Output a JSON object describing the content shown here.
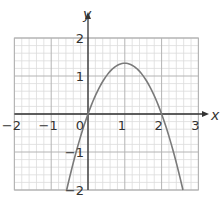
{
  "chart_data": {
    "type": "line",
    "title": "",
    "xlabel": "x",
    "ylabel": "y",
    "xlim": [
      -2,
      3
    ],
    "ylim": [
      -2,
      2
    ],
    "x_ticks": [
      "-2",
      "-1",
      "0",
      "1",
      "2",
      "3"
    ],
    "y_ticks": [
      "2",
      "1",
      "-1",
      "-2"
    ],
    "x_tick_values": [
      -2,
      -1,
      0,
      1,
      2,
      3
    ],
    "y_tick_values": [
      2,
      1,
      -1,
      -2
    ],
    "grid": true,
    "grid_minor_step": 0.2,
    "grid_major_step": 1,
    "legend": null,
    "series": [
      {
        "name": "parabola",
        "description": "downward-opening parabola with roots at x=0 and x=2, vertex at (1, 1)",
        "x": [
          -0.58,
          -0.25,
          0,
          0.5,
          1,
          1.5,
          2,
          2.25,
          2.58
        ],
        "y": [
          -2,
          -0.6,
          0,
          0.75,
          1,
          0.75,
          0,
          -0.6,
          -2
        ],
        "color": "#7a7a7a"
      }
    ],
    "key_points": {
      "vertex": [
        1,
        1
      ],
      "roots": [
        0,
        2
      ],
      "y_intercept": 0
    }
  },
  "colors": {
    "minor_grid": "#dcdcdc",
    "major_grid": "#b4b4b4",
    "axis": "#333333",
    "curve": "#7a7a7a"
  }
}
